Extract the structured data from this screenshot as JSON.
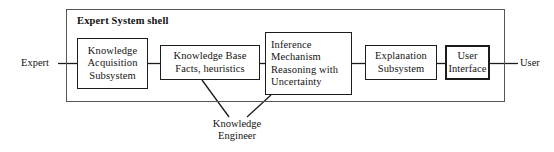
{
  "diagram": {
    "title": "Expert System shell",
    "nodes": [
      {
        "id": "knowledge-acquisition-subsystem",
        "lines": [
          "Knowledge",
          "Acquisition",
          "Subsystem"
        ],
        "border": "normal"
      },
      {
        "id": "knowledge-base",
        "lines": [
          "Knowledge Base",
          "Facts, heuristics"
        ],
        "border": "normal"
      },
      {
        "id": "inference-mechanism",
        "lines": [
          "Inference",
          "Mechanism",
          "Reasoning with",
          "Uncertainty"
        ],
        "border": "normal"
      },
      {
        "id": "explanation-subsystem",
        "lines": [
          "Explanation",
          "Subsystem"
        ],
        "border": "normal"
      },
      {
        "id": "user-interface",
        "lines": [
          "User",
          "Interface"
        ],
        "border": "thick"
      }
    ],
    "actors": {
      "left": "Expert",
      "right": "User"
    },
    "annotation": {
      "lines": [
        "Knowledge",
        "Engineer"
      ]
    },
    "colors": {
      "stroke": "#1c1c1c",
      "shell_stroke": "#565656",
      "text": "#141414",
      "background": "#ffffff"
    }
  }
}
